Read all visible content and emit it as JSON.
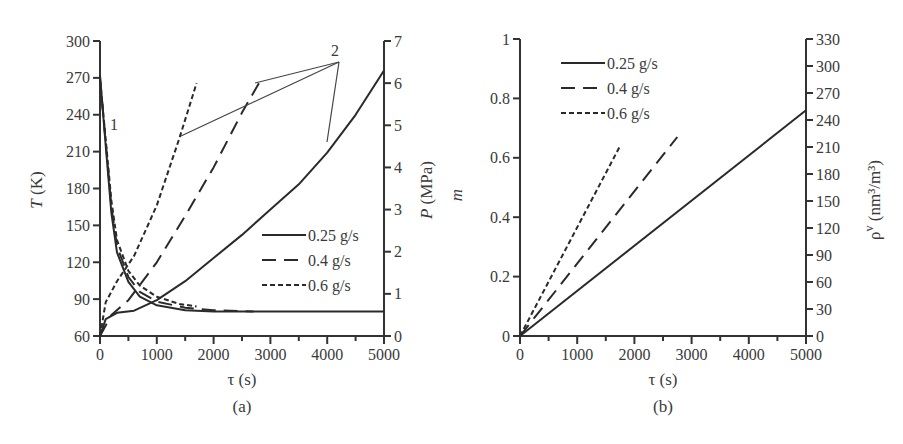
{
  "chart_data": [
    {
      "id": "a",
      "type": "line",
      "caption": "(a)",
      "xlabel": "τ (s)",
      "ylabel_left": "T (K)",
      "ylabel_right": "P (MPa)",
      "xlim": [
        0,
        5000
      ],
      "ylim_left": [
        60,
        300
      ],
      "ylim_right": [
        0,
        7
      ],
      "x_ticks": [
        "0",
        "1000",
        "2000",
        "3000",
        "4000",
        "5000"
      ],
      "y_ticks_left": [
        "60",
        "90",
        "120",
        "150",
        "180",
        "210",
        "240",
        "270",
        "300"
      ],
      "y_ticks_right": [
        "0",
        "1",
        "2",
        "3",
        "4",
        "5",
        "6",
        "7"
      ],
      "grid": false,
      "legend": {
        "position": "lower right",
        "entries": [
          "0.25 g/s",
          "0.4 g/s",
          "0.6 g/s"
        ]
      },
      "annotations": [
        {
          "text": "1",
          "meaning": "temperature curves group",
          "x": 100,
          "y": 236
        },
        {
          "text": "2",
          "meaning": "pressure curves group",
          "x": 4200,
          "y": 6.6
        }
      ],
      "series": [
        {
          "name": "0.25 g/s",
          "group": "T (curve 1)",
          "axis": "left",
          "style": "solid",
          "x": [
            0,
            100,
            200,
            300,
            500,
            700,
            1000,
            1500,
            2000,
            3000,
            5000
          ],
          "y": [
            272,
            215,
            160,
            128,
            104,
            92,
            85,
            81,
            80,
            80,
            80
          ]
        },
        {
          "name": "0.4 g/s",
          "group": "T (curve 1)",
          "axis": "left",
          "style": "dashed",
          "x": [
            0,
            100,
            200,
            300,
            500,
            700,
            1000,
            1500,
            2000,
            2700
          ],
          "y": [
            270,
            218,
            165,
            133,
            108,
            96,
            88,
            83,
            81,
            80
          ]
        },
        {
          "name": "0.6 g/s",
          "group": "T (curve 1)",
          "axis": "left",
          "style": "dotted",
          "x": [
            0,
            100,
            200,
            300,
            500,
            700,
            1000,
            1400,
            1700
          ],
          "y": [
            268,
            220,
            170,
            138,
            113,
            101,
            92,
            86,
            84
          ]
        },
        {
          "name": "0.25 g/s",
          "group": "P (curve 2)",
          "axis": "right",
          "style": "solid",
          "x": [
            0,
            100,
            300,
            600,
            1000,
            1500,
            2000,
            2500,
            3000,
            3500,
            4000,
            4500,
            5000
          ],
          "y": [
            0.0,
            0.4,
            0.55,
            0.6,
            0.85,
            1.3,
            1.85,
            2.4,
            3.0,
            3.6,
            4.35,
            5.25,
            6.3
          ]
        },
        {
          "name": "0.4 g/s",
          "group": "P (curve 2)",
          "axis": "right",
          "style": "dashed",
          "x": [
            0,
            200,
            500,
            1000,
            1500,
            2000,
            2500,
            2800
          ],
          "y": [
            0.0,
            0.5,
            0.85,
            1.75,
            2.85,
            4.0,
            5.3,
            6.0
          ]
        },
        {
          "name": "0.6 g/s",
          "group": "P (curve 2)",
          "axis": "right",
          "style": "dotted",
          "x": [
            0,
            100,
            300,
            600,
            1000,
            1400,
            1700
          ],
          "y": [
            0.0,
            0.8,
            1.3,
            1.9,
            3.1,
            4.7,
            6.0
          ]
        }
      ]
    },
    {
      "id": "b",
      "type": "line",
      "caption": "(b)",
      "xlabel": "τ (s)",
      "ylabel_left": "m",
      "ylabel_right": "ρ^v (nm³/m³)",
      "xlim": [
        0,
        5000
      ],
      "ylim_left": [
        0,
        1
      ],
      "ylim_right": [
        0,
        330
      ],
      "x_ticks": [
        "0",
        "1000",
        "2000",
        "3000",
        "4000",
        "5000"
      ],
      "y_ticks_left": [
        "0",
        "0.2",
        "0.4",
        "0.6",
        "0.8",
        "1"
      ],
      "y_ticks_right": [
        "0",
        "30",
        "60",
        "90",
        "120",
        "150",
        "180",
        "210",
        "240",
        "270",
        "300",
        "330"
      ],
      "grid": false,
      "legend": {
        "position": "upper left",
        "entries": [
          "0.25 g/s",
          "0.4 g/s",
          "0.6 g/s"
        ]
      },
      "series": [
        {
          "name": "0.25 g/s",
          "style": "solid",
          "x": [
            0,
            5000
          ],
          "y": [
            0,
            0.76
          ]
        },
        {
          "name": "0.4 g/s",
          "style": "dashed",
          "x": [
            0,
            2750
          ],
          "y": [
            0,
            0.67
          ]
        },
        {
          "name": "0.6 g/s",
          "style": "dotted",
          "x": [
            0,
            1750
          ],
          "y": [
            0,
            0.64
          ]
        }
      ]
    }
  ],
  "panel_a": {
    "caption": "(a)",
    "xlabel": "τ (s)",
    "ylabel_left_var": "T",
    "ylabel_left_unit": " (K)",
    "ylabel_right_var": "P",
    "ylabel_right_unit": " (MPa)",
    "annotation_1": "1",
    "annotation_2": "2",
    "legend": [
      "0.25 g/s",
      "0.4 g/s",
      "0.6 g/s"
    ]
  },
  "panel_b": {
    "caption": "(b)",
    "xlabel": "τ (s)",
    "ylabel_left_var": "m",
    "ylabel_right_main": "ρ",
    "ylabel_right_sup": "v",
    "ylabel_right_unit": " (nm³/m³)",
    "legend": [
      "0.25 g/s",
      "0.4 g/s",
      "0.6 g/s"
    ]
  }
}
